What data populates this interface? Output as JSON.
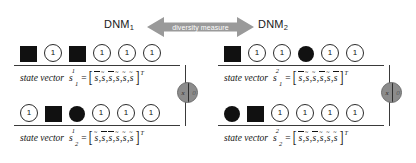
{
  "figure": {
    "arrow_label": "diversity measure",
    "colors": {
      "arrow_fill": "#9a9a9a",
      "arrow_text": "#ffffff",
      "node_fill": "#8c8c8c",
      "cell_fill": "#111111",
      "line": "#3a3a3a"
    }
  },
  "groups": [
    {
      "id": "dnm1",
      "header_label": "DNM",
      "header_sub": "1",
      "rows": [
        {
          "name": "state-vector-row-1",
          "cells": [
            {
              "shape": "square",
              "value": ""
            },
            {
              "shape": "ring",
              "value": "1"
            },
            {
              "shape": "square",
              "value": ""
            },
            {
              "shape": "ring",
              "value": "1"
            },
            {
              "shape": "ring",
              "value": "1"
            },
            {
              "shape": "ring",
              "value": "1"
            }
          ],
          "caption": {
            "text": "state vector",
            "symbol": "s",
            "sub": "1",
            "sup": "1",
            "equals": "=",
            "components": [
              {
                "base": "s",
                "accent": "bar"
              },
              {
                "base": "s",
                "accent": "tilde"
              },
              {
                "base": "s",
                "accent": "bar"
              },
              {
                "base": "s",
                "accent": "tilde"
              },
              {
                "base": "s",
                "accent": "tilde"
              },
              {
                "base": "s",
                "accent": "tilde"
              }
            ],
            "transpose": "T"
          }
        },
        {
          "name": "state-vector-row-2",
          "cells": [
            {
              "shape": "ring",
              "value": "1"
            },
            {
              "shape": "square",
              "value": ""
            },
            {
              "shape": "disc",
              "value": ""
            },
            {
              "shape": "ring",
              "value": "1"
            },
            {
              "shape": "ring",
              "value": "1"
            },
            {
              "shape": "ring",
              "value": "1"
            }
          ],
          "caption": {
            "text": "state vector",
            "symbol": "s",
            "sub": "2",
            "sup": "1",
            "equals": "=",
            "components": [
              {
                "base": "s",
                "accent": "tilde"
              },
              {
                "base": "s",
                "accent": "bar"
              },
              {
                "base": "s",
                "accent": "bar"
              },
              {
                "base": "s",
                "accent": "tilde"
              },
              {
                "base": "s",
                "accent": "tilde"
              },
              {
                "base": "s",
                "accent": "tilde"
              }
            ],
            "transpose": "T"
          }
        }
      ],
      "node": {
        "left": "x",
        "right": "0"
      }
    },
    {
      "id": "dnm2",
      "header_label": "DNM",
      "header_sub": "2",
      "rows": [
        {
          "name": "state-vector-row-1",
          "cells": [
            {
              "shape": "square",
              "value": ""
            },
            {
              "shape": "ring",
              "value": "1"
            },
            {
              "shape": "ring",
              "value": "1"
            },
            {
              "shape": "disc",
              "value": ""
            },
            {
              "shape": "ring",
              "value": "1"
            },
            {
              "shape": "ring",
              "value": "1"
            }
          ],
          "caption": {
            "text": "state vector",
            "symbol": "s",
            "sub": "1",
            "sup": "2",
            "equals": "=",
            "components": [
              {
                "base": "s",
                "accent": "bar"
              },
              {
                "base": "s",
                "accent": "tilde"
              },
              {
                "base": "s",
                "accent": "tilde"
              },
              {
                "base": "s",
                "accent": "bar"
              },
              {
                "base": "s",
                "accent": "tilde"
              },
              {
                "base": "s",
                "accent": "bar"
              }
            ],
            "transpose": "T"
          }
        },
        {
          "name": "state-vector-row-2",
          "cells": [
            {
              "shape": "disc",
              "value": ""
            },
            {
              "shape": "square",
              "value": ""
            },
            {
              "shape": "ring",
              "value": "1"
            },
            {
              "shape": "ring",
              "value": "1"
            },
            {
              "shape": "ring",
              "value": "1"
            },
            {
              "shape": "ring",
              "value": "1"
            }
          ],
          "caption": {
            "text": "state vector",
            "symbol": "s",
            "sub": "2",
            "sup": "2",
            "equals": "=",
            "components": [
              {
                "base": "s",
                "accent": "bar"
              },
              {
                "base": "s",
                "accent": "tilde"
              },
              {
                "base": "s",
                "accent": "bar"
              },
              {
                "base": "s",
                "accent": "tilde"
              },
              {
                "base": "s",
                "accent": "tilde"
              },
              {
                "base": "s",
                "accent": "tilde"
              }
            ],
            "transpose": "T"
          }
        }
      ],
      "node": {
        "left": "x",
        "right": "0"
      }
    }
  ]
}
